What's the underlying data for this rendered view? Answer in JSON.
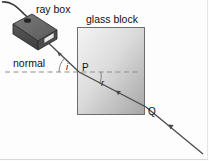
{
  "figure": {
    "labels": {
      "ray_box": "ray box",
      "glass_block": "glass block",
      "normal": "normal",
      "point_entry": "P",
      "point_exit": "Q",
      "angle_incidence": "i",
      "angle_refraction": "r"
    },
    "colors": {
      "ray": "#4a4a4a",
      "normal_line": "#8a8a8a",
      "block_border": "#6e6e6e",
      "block_fill_light": "#f2f2f2",
      "block_fill_dark": "#a8a8a8",
      "ray_box_body": "#5b5b5b",
      "ray_box_top": "#6e6e6e",
      "ray_box_side": "#3f3f3f",
      "text": "#111111",
      "background": "#fdfdfd"
    },
    "geometry": {
      "block": {
        "x": 77,
        "y": 27,
        "width": 68,
        "height": 88
      },
      "normal_line": {
        "x1": 5,
        "y1": 72,
        "x2": 140,
        "y2": 72
      },
      "entry_point": {
        "x": 79,
        "y": 72
      },
      "exit_point": {
        "x": 145,
        "y": 107
      },
      "incident_ray": {
        "x1": 40,
        "y1": 35,
        "x2": 79,
        "y2": 72
      },
      "refracted_ray": {
        "x1": 79,
        "y1": 72,
        "x2": 145,
        "y2": 107
      },
      "emergent_ray": {
        "x1": 145,
        "y1": 107,
        "x2": 201,
        "y2": 152
      },
      "angle_i_arc_radius": 20,
      "angle_r_arc_radius": 22
    },
    "icons": {
      "arrow": "arrowhead-icon",
      "cable": "power-cable-icon"
    }
  }
}
